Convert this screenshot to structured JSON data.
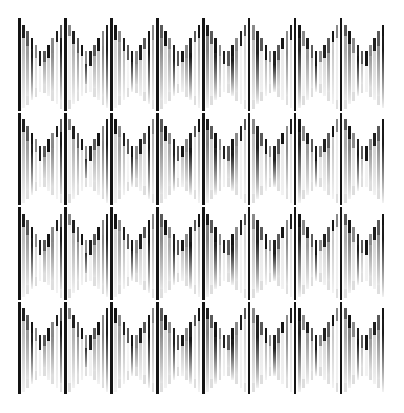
{
  "canvas": {
    "width": 404,
    "height": 413,
    "background_color": "#ffffff",
    "title": "Chevron Bar Pattern"
  },
  "artwork": {
    "name": "vertical-bar-chevron-field",
    "description": "Field of thin vertical grayscale bars grouped into horizontal bands whose top and bottom edges form repeating downward chevrons.",
    "plot_area": {
      "left": 18,
      "top": 18,
      "width": 368,
      "height": 378
    },
    "bar": {
      "count": 88,
      "pitch": 4.18,
      "width": 2.6,
      "gap": 1.58
    },
    "bands": {
      "count": 4,
      "height": 94.5,
      "tops": [
        18,
        112.5,
        207,
        301.5
      ],
      "chevron": {
        "periods_across": 8,
        "bars_per_period": 11,
        "amplitude_top": 40,
        "amplitude_bottom": 40,
        "direction": "down"
      }
    },
    "palette": {
      "background": "#ffffff",
      "lightest": "#f2f2f2",
      "light": "#dedede",
      "mid_light": "#c4c4c4",
      "mid": "#a8a8a8",
      "mid_dark": "#8a8a8a",
      "dark": "#5a5a5a",
      "accent_dark": "#1f1f1f",
      "accent_black": "#141414"
    },
    "accent": {
      "note": "Every 11th bar (chevron period boundary) is rendered in near-black and extends the full band height.",
      "period": 11,
      "offset": 0
    },
    "shades": [
      "#e8e8e8",
      "#bdbdbd",
      "#9e9e9e",
      "#1f1f1f",
      "#d6d6d6",
      "#f0f0f0",
      "#a5a5a5",
      "#cfcfcf",
      "#8f8f8f",
      "#e2e2e2",
      "#1a1a1a",
      "#c9c9c9",
      "#ededed",
      "#b2b2b2",
      "#979797",
      "#dcdcdc",
      "#242424",
      "#f2f2f2",
      "#aeaeae",
      "#c2c2c2",
      "#868686",
      "#1c1c1c",
      "#e5e5e5",
      "#d2d2d2",
      "#a1a1a1",
      "#bbbbbb",
      "#f4f4f4",
      "#2a2a2a",
      "#939393",
      "#cccccc",
      "#e0e0e0",
      "#181818",
      "#b7b7b7",
      "#eaeaea",
      "#8c8c8c",
      "#d9d9d9",
      "#aaaaaa",
      "#202020",
      "#f1f1f1",
      "#c6c6c6",
      "#9a9a9a",
      "#161616",
      "#dfdfdf",
      "#b5b5b5",
      "#efefef",
      "#828282",
      "#d0d0d0",
      "#262626",
      "#a7a7a7",
      "#e7e7e7",
      "#c0c0c0",
      "#1d1d1d",
      "#999999",
      "#f3f3f3",
      "#d4d4d4",
      "#8e8e8e",
      "#bebebe",
      "#212121",
      "#e9e9e9",
      "#b0b0b0",
      "#cacaca",
      "#151515",
      "#a3a3a3",
      "#ebebeb",
      "#898989",
      "#dbdbdb",
      "#c5c5c5",
      "#282828",
      "#f5f5f5",
      "#9c9c9c",
      "#b9b9b9",
      "#191919",
      "#e3e3e3",
      "#d7d7d7",
      "#959595",
      "#c8c8c8",
      "#ededed",
      "#232323",
      "#ababab",
      "#848484",
      "#dddddd",
      "#171717",
      "#bcbcbc",
      "#f0f0f0",
      "#a0a0a0",
      "#d3d3d3",
      "#909090",
      "#1b1b1b"
    ]
  }
}
